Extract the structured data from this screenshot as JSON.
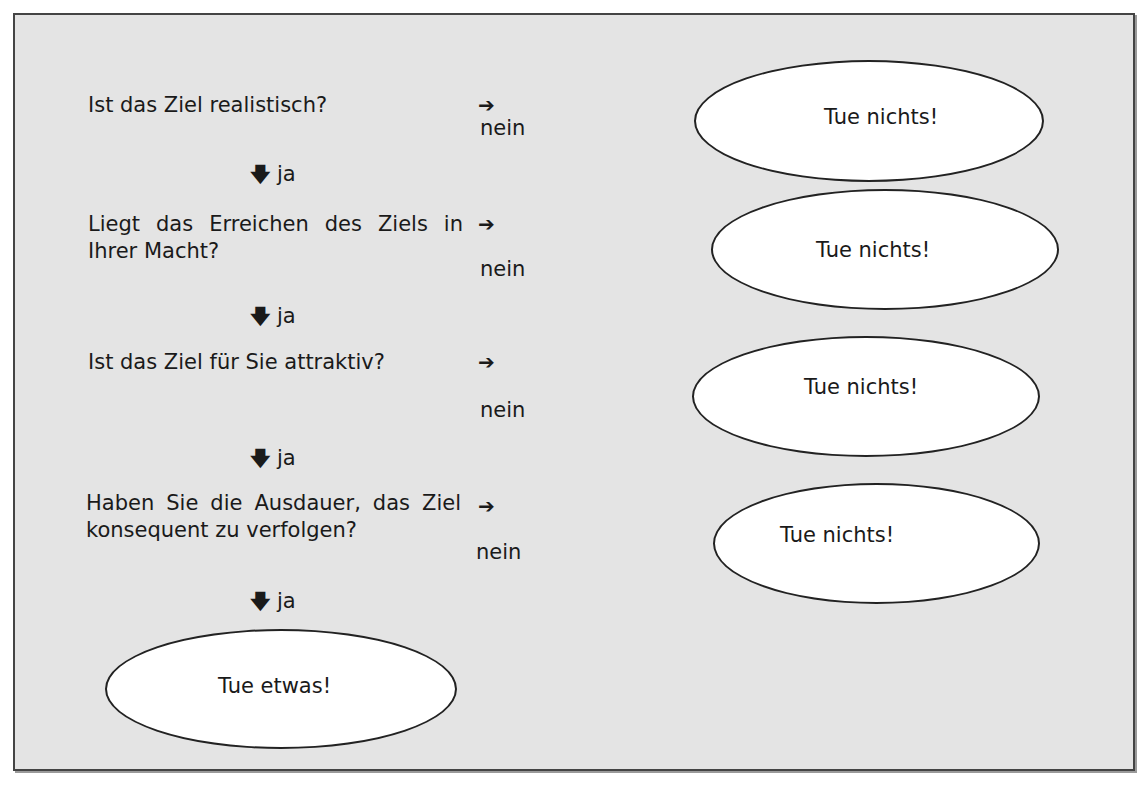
{
  "questions": [
    {
      "text": "Ist das Ziel realistisch?"
    },
    {
      "text": "Liegt das Erreichen des Ziels in Ihrer Macht?"
    },
    {
      "text": "Ist das Ziel für Sie attraktiv?"
    },
    {
      "text": "Haben Sie die Ausdauer, das Ziel konsequent zu verfolgen?"
    }
  ],
  "arrows": {
    "right": "➔",
    "down": "🡇"
  },
  "labels": {
    "no": "nein",
    "yes": "ja"
  },
  "outcomes": {
    "no_action": [
      "Tue nichts!",
      "Tue nichts!",
      "Tue nichts!",
      "Tue nichts!"
    ],
    "action": "Tue etwas!"
  }
}
